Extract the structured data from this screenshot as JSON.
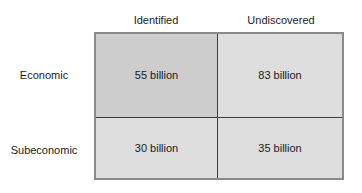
{
  "figure": {
    "colors": {
      "cell_shaded": "#cdcdcd",
      "cell_plain": "#dedede",
      "outer_border": "#8a8a8a",
      "inner_divider": "#3c3c3c",
      "text": "#1a1a1a",
      "background": "#ffffff"
    }
  },
  "column_headers": [
    {
      "label": "Identified"
    },
    {
      "label": "Undiscovered"
    }
  ],
  "row_labels": [
    {
      "label": "Economic"
    },
    {
      "label": "Subeconomic"
    }
  ],
  "cells": [
    {
      "row": "Economic",
      "column": "Identified",
      "value": "55 billion"
    },
    {
      "row": "Economic",
      "column": "Undiscovered",
      "value": "83 billion"
    },
    {
      "row": "Subeconomic",
      "column": "Identified",
      "value": "30 billion"
    },
    {
      "row": "Subeconomic",
      "column": "Undiscovered",
      "value": "35 billion"
    }
  ],
  "chart_data": {
    "type": "table",
    "title": "",
    "xlabel": "",
    "ylabel": "",
    "categories": [
      "Identified",
      "Undiscovered"
    ],
    "row_categories": [
      "Economic",
      "Subeconomic"
    ],
    "series": [
      {
        "name": "Economic",
        "values": [
          55,
          83
        ]
      },
      {
        "name": "Subeconomic",
        "values": [
          30,
          35
        ]
      }
    ],
    "value_labels": [
      [
        "55 billion",
        "83 billion"
      ],
      [
        "30 billion",
        "35 billion"
      ]
    ],
    "units": "billion",
    "grid": true,
    "legend": "none",
    "highlighted_cell": {
      "row": "Economic",
      "column": "Identified"
    }
  }
}
